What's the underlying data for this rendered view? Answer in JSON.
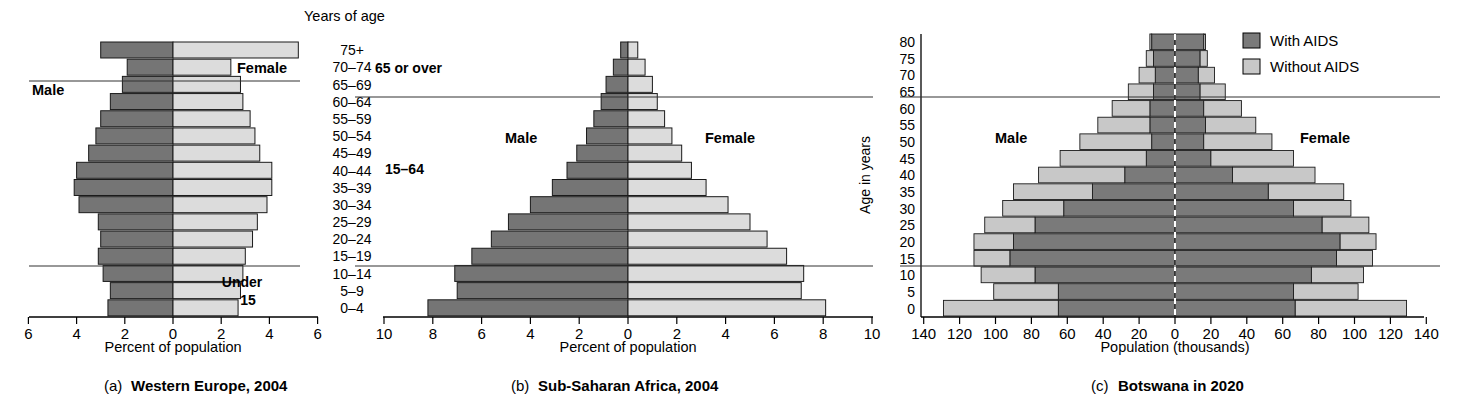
{
  "figure": {
    "age_header": "Years of age",
    "age_labels": [
      "75+",
      "70–74",
      "65–69",
      "60–64",
      "55–59",
      "50–54",
      "45–49",
      "40–44",
      "35–39",
      "30–34",
      "25–29",
      "20–24",
      "15–19",
      "10–14",
      "5–9",
      "0–4"
    ],
    "bracket_labels": [
      "65 or over",
      "15–64",
      "Under 15"
    ],
    "sex_male": "Male",
    "sex_female": "Female",
    "colors": {
      "male_dark": "#757575",
      "female_light": "#dcdcdc",
      "with_aids": "#7a7a7a",
      "without_aids": "#c8c8c8",
      "axis": "#000000",
      "divider": "#333333",
      "center_dashed": "#ffffff"
    },
    "legend": {
      "items": [
        {
          "label": "With AIDS",
          "swatch": "#7a7a7a"
        },
        {
          "label": "Without AIDS",
          "swatch": "#c8c8c8"
        }
      ]
    }
  },
  "chart_data": [
    {
      "id": "a",
      "type": "bar",
      "orientation": "population-pyramid",
      "title": "Western Europe, 2004",
      "caption_prefix": "(a)",
      "xlabel": "Percent of population",
      "ylabel": "Years of age",
      "xlim": [
        -6,
        6
      ],
      "xticks": [
        6,
        4,
        2,
        0,
        2,
        4,
        6
      ],
      "grid": false,
      "categories": [
        "75+",
        "70–74",
        "65–69",
        "60–64",
        "55–59",
        "50–54",
        "45–49",
        "40–44",
        "35–39",
        "30–34",
        "25–29",
        "20–24",
        "15–19",
        "10–14",
        "5–9",
        "0–4"
      ],
      "series": [
        {
          "name": "Male",
          "values": [
            3.0,
            1.9,
            2.1,
            2.6,
            3.0,
            3.2,
            3.5,
            4.0,
            4.1,
            3.9,
            3.1,
            3.0,
            3.1,
            2.9,
            2.6,
            2.7
          ]
        },
        {
          "name": "Female",
          "values": [
            5.2,
            2.4,
            2.8,
            2.9,
            3.2,
            3.4,
            3.6,
            4.1,
            4.1,
            3.9,
            3.5,
            3.3,
            3.0,
            2.9,
            2.8,
            2.7
          ]
        }
      ]
    },
    {
      "id": "b",
      "type": "bar",
      "orientation": "population-pyramid",
      "title": "Sub-Saharan Africa, 2004",
      "caption_prefix": "(b)",
      "xlabel": "Percent of population",
      "ylabel": "Years of age",
      "xlim": [
        -10,
        10
      ],
      "xticks": [
        10,
        8,
        6,
        4,
        2,
        0,
        2,
        4,
        6,
        8,
        10
      ],
      "grid": false,
      "categories": [
        "75+",
        "70–74",
        "65–69",
        "60–64",
        "55–59",
        "50–54",
        "45–49",
        "40–44",
        "35–39",
        "30–34",
        "25–29",
        "20–24",
        "15–19",
        "10–14",
        "5–9",
        "0–4"
      ],
      "series": [
        {
          "name": "Male",
          "values": [
            0.3,
            0.6,
            0.9,
            1.1,
            1.4,
            1.7,
            2.1,
            2.5,
            3.1,
            4.0,
            4.9,
            5.6,
            6.4,
            7.1,
            7.0,
            8.2
          ]
        },
        {
          "name": "Female",
          "values": [
            0.4,
            0.7,
            1.0,
            1.2,
            1.5,
            1.8,
            2.2,
            2.6,
            3.2,
            4.1,
            5.0,
            5.7,
            6.5,
            7.2,
            7.1,
            8.1
          ]
        }
      ]
    },
    {
      "id": "c",
      "type": "bar",
      "orientation": "population-pyramid-stacked",
      "title": "Botswana in 2020",
      "caption_prefix": "(c)",
      "xlabel": "Population (thousands)",
      "ylabel": "Age in years",
      "xlim": [
        -140,
        140
      ],
      "xticks": [
        140,
        120,
        100,
        80,
        60,
        40,
        20,
        0,
        20,
        40,
        60,
        80,
        100,
        120,
        140
      ],
      "grid": false,
      "categories": [
        "80",
        "75",
        "70",
        "65",
        "60",
        "55",
        "50",
        "45",
        "40",
        "35",
        "30",
        "25",
        "20",
        "15",
        "10",
        "5",
        "0"
      ],
      "series": [
        {
          "name": "Male with AIDS",
          "values": [
            13,
            12,
            11,
            12,
            14,
            14,
            13,
            16,
            28,
            46,
            62,
            78,
            90,
            92,
            78,
            65,
            65
          ]
        },
        {
          "name": "Male without AIDS",
          "values": [
            1,
            4,
            9,
            14,
            21,
            29,
            40,
            48,
            48,
            44,
            34,
            28,
            22,
            20,
            30,
            36,
            64
          ]
        },
        {
          "name": "Female with AIDS",
          "values": [
            16,
            14,
            13,
            14,
            16,
            17,
            16,
            20,
            32,
            52,
            66,
            82,
            92,
            90,
            76,
            66,
            67
          ]
        },
        {
          "name": "Female without AIDS",
          "values": [
            1,
            4,
            9,
            14,
            21,
            28,
            38,
            46,
            46,
            42,
            32,
            26,
            20,
            20,
            29,
            36,
            62
          ]
        }
      ]
    }
  ]
}
